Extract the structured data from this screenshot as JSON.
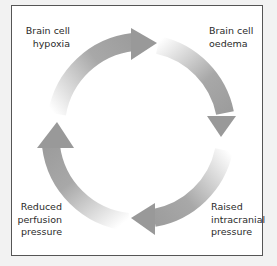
{
  "diagram": {
    "type": "cycle",
    "direction": "clockwise",
    "nodes": [
      {
        "id": "hypoxia",
        "label": "Brain cell\nhypoxia",
        "position": "top-left"
      },
      {
        "id": "oedema",
        "label": "Brain cell\noedema",
        "position": "top-right"
      },
      {
        "id": "icp",
        "label": "Raised\nintracranial\npressure",
        "position": "bottom-right"
      },
      {
        "id": "perfusion",
        "label": "Reduced\nperfusion\npressure",
        "position": "bottom-left"
      }
    ],
    "edges": [
      {
        "from": "perfusion",
        "to": "hypoxia"
      },
      {
        "from": "hypoxia",
        "to": "oedema"
      },
      {
        "from": "oedema",
        "to": "icp"
      },
      {
        "from": "icp",
        "to": "perfusion"
      }
    ],
    "colors": {
      "arrow": "#999999",
      "arrow_fade": "#ffffff",
      "text": "#2a2a2a",
      "frame_border": "#555555",
      "frame_bg": "#ffffff",
      "page_bg": "#f2f2f2"
    }
  }
}
